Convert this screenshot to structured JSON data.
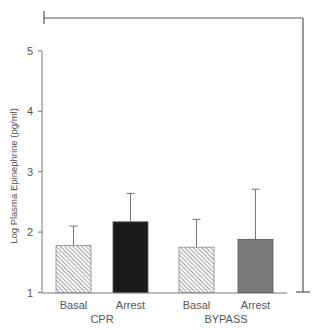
{
  "chart_data": {
    "type": "bar",
    "title": "",
    "xlabel": "",
    "ylabel": "Log Plasma Epinephrine (pg/ml)",
    "ylim": [
      1,
      5
    ],
    "yticks": [
      1,
      2,
      3,
      4,
      5
    ],
    "grid": false,
    "legend": null,
    "groups": [
      {
        "name": "CPR",
        "bars": [
          {
            "label": "Basal",
            "value": 1.78,
            "error_upper": 2.1,
            "fill": "hatched"
          },
          {
            "label": "Arrest",
            "value": 2.17,
            "error_upper": 2.64,
            "fill": "#1a1a1a"
          }
        ]
      },
      {
        "name": "BYPASS",
        "bars": [
          {
            "label": "Basal",
            "value": 1.75,
            "error_upper": 2.21,
            "fill": "hatched"
          },
          {
            "label": "Arrest",
            "value": 1.88,
            "error_upper": 2.71,
            "fill": "#7a7a7a"
          }
        ]
      }
    ],
    "categories": [
      "Basal",
      "Arrest",
      "Basal",
      "Arrest"
    ],
    "values": [
      1.78,
      2.17,
      1.75,
      1.88
    ],
    "error_tops": [
      2.1,
      2.64,
      2.21,
      2.71
    ],
    "annotations": [
      "significance bracket spanning from top-left over the chart to the right side, down to baseline"
    ]
  },
  "colors": {
    "axis": "#777777",
    "hatch": "#777777",
    "cpr_arrest": "#1a1a1a",
    "bypass_arrest": "#7a7a7a",
    "bracket": "#555555"
  }
}
